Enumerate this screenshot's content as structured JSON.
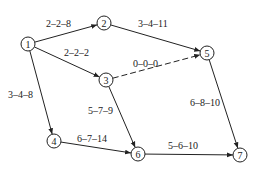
{
  "diagram": {
    "type": "activity network",
    "nodes": [
      {
        "id": "1",
        "label": "1",
        "x": 28,
        "y": 44
      },
      {
        "id": "2",
        "label": "2",
        "x": 104,
        "y": 23
      },
      {
        "id": "3",
        "label": "3",
        "x": 106,
        "y": 80
      },
      {
        "id": "4",
        "label": "4",
        "x": 54,
        "y": 141
      },
      {
        "id": "5",
        "label": "5",
        "x": 207,
        "y": 53
      },
      {
        "id": "6",
        "label": "6",
        "x": 138,
        "y": 154
      },
      {
        "id": "7",
        "label": "7",
        "x": 240,
        "y": 155
      }
    ],
    "edges": [
      {
        "from": "1",
        "to": "2",
        "label": "2–2–8",
        "dashed": false,
        "lx": 46,
        "ly": 27
      },
      {
        "from": "1",
        "to": "3",
        "label": "2–2–2",
        "dashed": false,
        "lx": 64,
        "ly": 56
      },
      {
        "from": "1",
        "to": "4",
        "label": "3–4–8",
        "dashed": false,
        "lx": 8,
        "ly": 98
      },
      {
        "from": "2",
        "to": "5",
        "label": "3–4–11",
        "dashed": false,
        "lx": 138,
        "ly": 27
      },
      {
        "from": "3",
        "to": "5",
        "label": "0–0–0",
        "dashed": true,
        "lx": 133,
        "ly": 67
      },
      {
        "from": "3",
        "to": "6",
        "label": "5–7–9",
        "dashed": false,
        "lx": 88,
        "ly": 114
      },
      {
        "from": "4",
        "to": "6",
        "label": "6–7–14",
        "dashed": false,
        "lx": 77,
        "ly": 142
      },
      {
        "from": "5",
        "to": "7",
        "label": "6–8–10",
        "dashed": false,
        "lx": 190,
        "ly": 106
      },
      {
        "from": "6",
        "to": "7",
        "label": "5–6–10",
        "dashed": false,
        "lx": 168,
        "ly": 149
      }
    ]
  }
}
